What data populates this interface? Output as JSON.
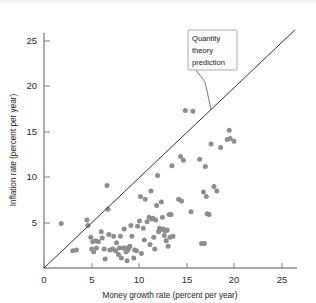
{
  "figure": {
    "background_color": "#ffffff",
    "point_color": "#8e8e8e",
    "line_color": "#333333",
    "axis_color": "#8a8a8a"
  },
  "axes": {
    "x_title": "Money growth rate (percent per year)",
    "y_title": "Inflation rate (percent per year)",
    "x_ticks": [
      "0",
      "5",
      "10",
      "15",
      "20",
      "25"
    ],
    "y_ticks": [
      "5",
      "10",
      "15",
      "20",
      "25"
    ],
    "x_origin_label": "0"
  },
  "annotation": {
    "line1": "Quantity",
    "line2": "theory",
    "line3": "prediction"
  },
  "chart_data": {
    "type": "scatter",
    "title": "",
    "xlabel": "Money growth rate (percent per year)",
    "ylabel": "Inflation rate (percent per year)",
    "xlim": [
      0,
      26.5
    ],
    "ylim": [
      0,
      26.5
    ],
    "xticks": [
      0,
      5,
      10,
      15,
      20,
      25
    ],
    "yticks": [
      0,
      5,
      10,
      15,
      20,
      25
    ],
    "grid": false,
    "legend": null,
    "annotations": [
      {
        "text": "Quantity theory prediction",
        "target_x": 17.5,
        "target_y": 17.5,
        "box_x": 15.2,
        "box_y": 24.2
      }
    ],
    "reference_line": {
      "name": "Quantity theory prediction",
      "type": "identity",
      "slope": 1,
      "intercept": 0,
      "x_from": 0,
      "x_to": 26.3
    },
    "series": [
      {
        "name": "Countries",
        "marker": "circle",
        "color": "#8e8e8e",
        "points": [
          [
            1.8,
            4.9
          ],
          [
            3.0,
            1.9
          ],
          [
            3.4,
            2.0
          ],
          [
            4.5,
            5.3
          ],
          [
            4.6,
            4.7
          ],
          [
            4.9,
            3.4
          ],
          [
            5.0,
            2.1
          ],
          [
            5.1,
            2.9
          ],
          [
            5.2,
            1.8
          ],
          [
            5.4,
            3.0
          ],
          [
            5.5,
            2.2
          ],
          [
            5.7,
            2.9
          ],
          [
            6.0,
            4.0
          ],
          [
            6.1,
            3.3
          ],
          [
            6.3,
            2.1
          ],
          [
            6.4,
            1.0
          ],
          [
            6.6,
            9.1
          ],
          [
            6.7,
            6.5
          ],
          [
            6.8,
            3.7
          ],
          [
            6.9,
            2.0
          ],
          [
            7.2,
            2.1
          ],
          [
            7.3,
            3.5
          ],
          [
            7.5,
            1.9
          ],
          [
            7.6,
            2.8
          ],
          [
            7.8,
            1.5
          ],
          [
            7.9,
            2.2
          ],
          [
            8.0,
            3.5
          ],
          [
            8.1,
            1.1
          ],
          [
            8.3,
            2.2
          ],
          [
            8.4,
            4.3
          ],
          [
            8.5,
            2.2
          ],
          [
            8.6,
            1.8
          ],
          [
            8.7,
            0.8
          ],
          [
            8.8,
            2.0
          ],
          [
            8.9,
            2.3
          ],
          [
            9.0,
            2.4
          ],
          [
            9.1,
            4.7
          ],
          [
            9.2,
            3.5
          ],
          [
            9.4,
            1.1
          ],
          [
            9.5,
            2.0
          ],
          [
            9.7,
            1.9
          ],
          [
            9.8,
            4.6
          ],
          [
            10.0,
            5.2
          ],
          [
            10.1,
            7.9
          ],
          [
            10.2,
            1.6
          ],
          [
            10.4,
            4.4
          ],
          [
            10.5,
            3.1
          ],
          [
            10.6,
            7.6
          ],
          [
            10.8,
            5.1
          ],
          [
            11.0,
            5.6
          ],
          [
            11.1,
            2.6
          ],
          [
            11.2,
            8.5
          ],
          [
            11.3,
            5.4
          ],
          [
            11.4,
            5.5
          ],
          [
            11.5,
            3.4
          ],
          [
            11.6,
            2.1
          ],
          [
            11.7,
            5.3
          ],
          [
            11.8,
            6.9
          ],
          [
            11.9,
            10.2
          ],
          [
            12.0,
            4.0
          ],
          [
            12.1,
            4.4
          ],
          [
            12.2,
            4.2
          ],
          [
            12.3,
            7.3
          ],
          [
            12.4,
            5.6
          ],
          [
            12.5,
            4.3
          ],
          [
            12.6,
            3.6
          ],
          [
            12.7,
            4.1
          ],
          [
            12.8,
            3.0
          ],
          [
            12.9,
            4.2
          ],
          [
            13.0,
            2.4
          ],
          [
            13.1,
            5.9
          ],
          [
            13.2,
            3.4
          ],
          [
            13.3,
            5.9
          ],
          [
            13.4,
            11.3
          ],
          [
            13.5,
            3.5
          ],
          [
            14.1,
            7.6
          ],
          [
            14.3,
            12.3
          ],
          [
            14.4,
            7.4
          ],
          [
            14.6,
            11.9
          ],
          [
            14.8,
            17.4
          ],
          [
            15.4,
            6.2
          ],
          [
            15.6,
            17.3
          ],
          [
            16.3,
            12.0
          ],
          [
            16.5,
            2.7
          ],
          [
            16.7,
            8.4
          ],
          [
            16.8,
            2.7
          ],
          [
            16.9,
            11.2
          ],
          [
            17.0,
            7.9
          ],
          [
            17.1,
            6.0
          ],
          [
            17.3,
            5.9
          ],
          [
            17.5,
            13.7
          ],
          [
            17.8,
            9.0
          ],
          [
            18.1,
            8.5
          ],
          [
            18.5,
            13.3
          ],
          [
            19.2,
            14.2
          ],
          [
            19.4,
            15.2
          ],
          [
            19.5,
            14.3
          ],
          [
            19.9,
            14.0
          ]
        ]
      }
    ]
  }
}
